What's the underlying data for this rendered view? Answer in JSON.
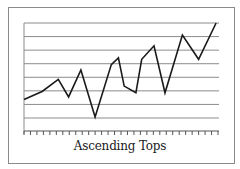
{
  "chart_data": {
    "type": "line",
    "title": "Ascending Tops",
    "xlabel": "",
    "ylabel": "",
    "grid": true,
    "legend": null,
    "x_ticks": 31,
    "ylim": [
      0,
      8
    ],
    "gridlines": 8,
    "series": [
      {
        "name": "price",
        "x": [
          0,
          2.8,
          5.3,
          6.9,
          8.8,
          11.0,
          13.5,
          14.6,
          15.5,
          17.3,
          18.2,
          20.1,
          21.8,
          24.5,
          27.0,
          29.7
        ],
        "values": [
          2.3,
          2.9,
          3.8,
          2.5,
          4.5,
          1.0,
          4.9,
          5.4,
          3.3,
          2.8,
          5.3,
          6.3,
          2.8,
          7.1,
          5.3,
          8.0
        ]
      }
    ],
    "colors": {
      "line": "#1a1a1a",
      "grid": "#8c8c8c",
      "frame": "#8a8a8a"
    }
  },
  "chart": {
    "title": "Ascending Tops"
  }
}
